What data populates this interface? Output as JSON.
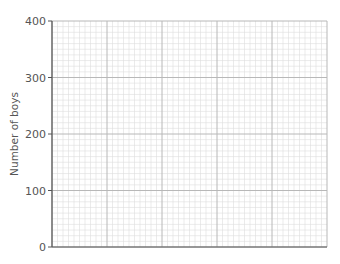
{
  "chart_data": {
    "type": "line",
    "title": "",
    "xlabel": "",
    "ylabel": "Number of boys",
    "ylim": [
      0,
      400
    ],
    "yticks": [
      0,
      100,
      200,
      300,
      400
    ],
    "x_major_divisions": 5,
    "minor_per_major": 10,
    "grid": true,
    "series": []
  },
  "colors": {
    "axis": "#555555",
    "major_grid": "#b8b8b8",
    "minor_grid": "#dedede",
    "text": "#555555"
  }
}
